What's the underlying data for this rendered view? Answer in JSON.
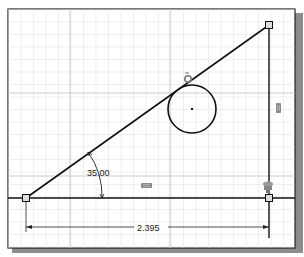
{
  "sketch": {
    "angle_dimension": "35.00",
    "linear_dimension": "2.395",
    "constraints": {
      "tangent": "tangent-constraint",
      "vertical": "vertical-constraint",
      "horizontal": "horizontal-constraint",
      "coincident": "coincident-constraint"
    }
  },
  "colors": {
    "grid": "#d8d8d8",
    "frame": "#222222",
    "shadow": "#8a8a8a",
    "geometry": "#111111"
  }
}
